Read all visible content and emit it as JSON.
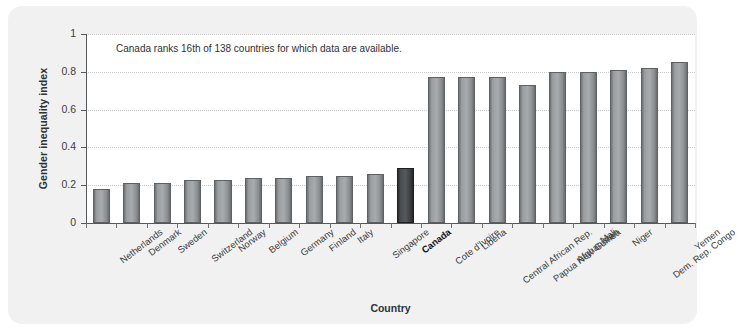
{
  "figure": {
    "annotation": "Canada ranks 16th of 138 countries for which data are available.",
    "background_color": "#f1f1f1",
    "plot_background_color": "#ffffff",
    "bar_color": "#a8abad",
    "highlight_bar_color": "#3b3e40",
    "highlight_category": "Canada"
  },
  "chart_data": {
    "type": "bar",
    "title": "",
    "xlabel": "Country",
    "ylabel": "Gender inequality index",
    "ylim": [
      0,
      1
    ],
    "yticks": [
      "0",
      "0.2",
      "0.4",
      "0.6",
      "0.8",
      "1"
    ],
    "ytick_values": [
      0,
      0.2,
      0.4,
      0.6,
      0.8,
      1
    ],
    "grid": true,
    "legend": "none",
    "categories": [
      "Netherlands",
      "Denmark",
      "Sweden",
      "Switzerland",
      "Norway",
      "Belgium",
      "Germany",
      "Finland",
      "Italy",
      "Singapore",
      "Canada",
      "Cote d'Ivoire",
      "Liberia",
      "Central African Rep.",
      "Papua New Guinea",
      "Afghanistan",
      "Mali",
      "Niger",
      "Dem. Rep. Congo",
      "Yemen"
    ],
    "values": [
      0.18,
      0.21,
      0.21,
      0.23,
      0.23,
      0.24,
      0.24,
      0.25,
      0.25,
      0.26,
      0.29,
      0.77,
      0.77,
      0.77,
      0.73,
      0.8,
      0.8,
      0.81,
      0.82,
      0.85
    ],
    "highlight_index": 10
  }
}
